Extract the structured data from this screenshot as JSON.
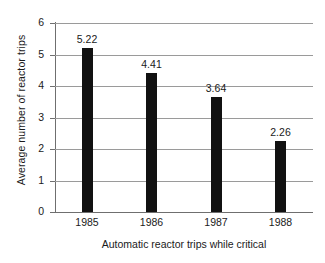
{
  "chart_data": {
    "type": "bar",
    "title": "",
    "subtitle": "",
    "xlabel": "Automatic reactor trips while critical",
    "ylabel": "Average number of reactor trips",
    "categories": [
      "1985",
      "1986",
      "1987",
      "1988"
    ],
    "values": [
      5.22,
      4.41,
      3.64,
      2.26
    ],
    "data_labels": [
      "5.22",
      "4.41",
      "3.64",
      "2.26"
    ],
    "ylim": [
      0,
      6
    ],
    "ytick_labels": [
      "0",
      "1",
      "2",
      "3",
      "4",
      "5",
      "6"
    ],
    "ytick_values": [
      0,
      1,
      2,
      3,
      4,
      5,
      6
    ],
    "grid": "horizontal",
    "legend": "none",
    "bar_color": "#111111",
    "gridline_color": "#9a9a9a",
    "axis_color": "#6f6f6f",
    "background_color": "#ffffff",
    "text_color": "#1a1a1a"
  }
}
